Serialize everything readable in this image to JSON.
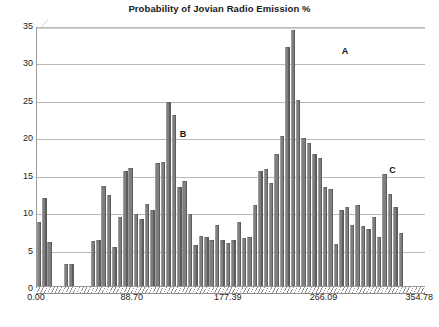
{
  "chart_data": {
    "type": "bar",
    "title": "Probability of Jovian Radio Emission %",
    "xlabel": "",
    "ylabel": "",
    "ylim": [
      0,
      35
    ],
    "xlim": [
      0,
      360
    ],
    "grid": true,
    "legend": null,
    "yticks": [
      0,
      5,
      10,
      15,
      20,
      25,
      30,
      35
    ],
    "xticks": [
      0.0,
      88.7,
      177.39,
      266.09,
      354.78
    ],
    "xtick_labels": [
      "0.00",
      "88.70",
      "177.39",
      "266.09",
      "354.78"
    ],
    "bar_color": "#7f7f7f",
    "categories": [
      "0.0",
      "5.0",
      "10.0",
      "15.0",
      "20.0",
      "25.0",
      "30.0",
      "35.0",
      "40.0",
      "45.0",
      "50.0",
      "55.0",
      "60.0",
      "65.0",
      "70.0",
      "75.0",
      "80.0",
      "85.0",
      "90.0",
      "95.0",
      "100.0",
      "105.0",
      "110.0",
      "115.0",
      "120.0",
      "125.0",
      "130.0",
      "135.0",
      "140.0",
      "145.0",
      "150.0",
      "155.0",
      "160.0",
      "165.0",
      "170.0",
      "175.0",
      "180.0",
      "185.0",
      "190.0",
      "195.0",
      "200.0",
      "205.0",
      "210.0",
      "215.0",
      "220.0",
      "225.0",
      "230.0",
      "235.0",
      "240.0",
      "245.0",
      "250.0",
      "255.0",
      "260.0",
      "265.0",
      "270.0",
      "275.0",
      "280.0",
      "285.0",
      "290.0",
      "295.0",
      "300.0",
      "305.0",
      "310.0",
      "315.0",
      "320.0",
      "325.0",
      "330.0",
      "335.0",
      "340.0",
      "345.0",
      "350.0",
      "355.0"
    ],
    "values": [
      9.0,
      12.2,
      6.3,
      0.0,
      0.0,
      3.3,
      3.4,
      0.0,
      0.0,
      0.0,
      6.4,
      6.5,
      13.7,
      12.5,
      5.6,
      9.6,
      15.7,
      16.2,
      10.0,
      9.3,
      11.4,
      10.6,
      16.8,
      17.0,
      25.0,
      23.3,
      13.6,
      14.4,
      10.0,
      5.9,
      7.1,
      7.0,
      6.5,
      8.5,
      6.6,
      6.1,
      6.6,
      9.0,
      6.8,
      7.0,
      11.2,
      15.7,
      16.0,
      14.2,
      18.0,
      20.4,
      32.3,
      34.6,
      25.3,
      20.2,
      19.5,
      18.0,
      17.5,
      13.6,
      13.4,
      6.0,
      10.6,
      11.0,
      8.5,
      11.2,
      8.4,
      8.0,
      9.6,
      7.0,
      15.3,
      12.7,
      10.9,
      7.5,
      0.0,
      0.0,
      0.0,
      0.0
    ],
    "annotations": [
      {
        "text": "A",
        "x_value": 283.0,
        "y_value": 32.5
      },
      {
        "text": "B",
        "x_value": 133.0,
        "y_value": 21.4
      },
      {
        "text": "C",
        "x_value": 327.0,
        "y_value": 16.6
      }
    ]
  }
}
